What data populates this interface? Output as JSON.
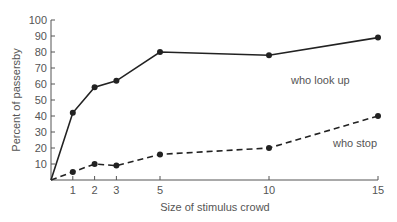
{
  "chart_data": {
    "type": "line",
    "title": "",
    "xlabel": "Size of stimulus crowd",
    "ylabel": "Percent of passersby",
    "x": [
      1,
      2,
      3,
      5,
      10,
      15
    ],
    "x_ticks": [
      1,
      2,
      3,
      5,
      10,
      15
    ],
    "y_ticks": [
      10,
      20,
      30,
      40,
      50,
      60,
      70,
      80,
      90,
      100
    ],
    "xlim": [
      0,
      15
    ],
    "ylim": [
      0,
      100
    ],
    "grid": false,
    "legend_position": "inline labels near series ends",
    "series": [
      {
        "name": "who look up",
        "style": "solid",
        "marker": "filled-circle",
        "values": [
          42,
          58,
          62,
          80,
          78,
          89
        ],
        "starts_at_origin": true
      },
      {
        "name": "who stop",
        "style": "dashed",
        "marker": "filled-circle",
        "values": [
          5,
          10,
          9,
          16,
          20,
          40
        ],
        "starts_at_origin": true
      }
    ],
    "colors": {
      "line": "#222222",
      "axis": "#555555",
      "text": "#555555"
    }
  }
}
